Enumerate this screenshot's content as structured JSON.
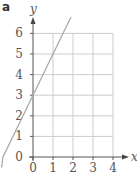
{
  "panel_label": "a",
  "chart_data": {
    "type": "line",
    "title": "",
    "xlabel": "x",
    "ylabel": "y",
    "xlim": [
      0,
      4
    ],
    "ylim": [
      0,
      6
    ],
    "xticks": [
      "0",
      "1",
      "2",
      "3",
      "4"
    ],
    "yticks": [
      "0",
      "1",
      "2",
      "3",
      "4",
      "5",
      "6"
    ],
    "grid": true,
    "series": [
      {
        "name": "y = 2x + 3",
        "x": [
          -1.5,
          0,
          1,
          1.9
        ],
        "values": [
          0,
          3,
          5,
          6.8
        ],
        "color": "#aaaaaa"
      }
    ]
  }
}
